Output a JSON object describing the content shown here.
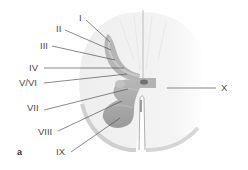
{
  "figure": {
    "panel_label": "a",
    "colors": {
      "white_matter": "#f3f3f3",
      "white_matter_edge": "#d8d8d8",
      "gray_matter": "#a8a8a8",
      "gray_matter_dark": "#8f8f8f",
      "dorsal_horn_light": "#c4c4c4",
      "leader_line": "#555555",
      "label_text": "#4a4a4a"
    },
    "labels": [
      {
        "id": "I",
        "text": "I"
      },
      {
        "id": "II",
        "text": "II"
      },
      {
        "id": "III",
        "text": "III"
      },
      {
        "id": "IV",
        "text": "IV"
      },
      {
        "id": "V_VI",
        "text": "V/VI"
      },
      {
        "id": "VII",
        "text": "VII"
      },
      {
        "id": "VIII",
        "text": "VIII"
      },
      {
        "id": "IX",
        "text": "IX"
      },
      {
        "id": "X",
        "text": "X"
      }
    ]
  }
}
